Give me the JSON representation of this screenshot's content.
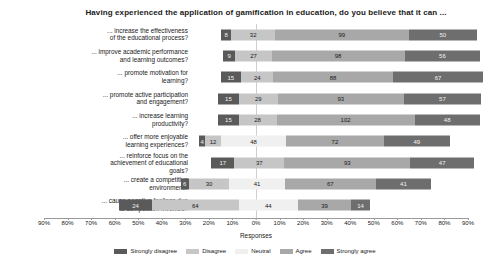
{
  "chart_data": {
    "type": "bar",
    "subtype": "diverging-stacked-likert",
    "title": "Having experienced the application of gamification in education, do you believe that it can ...",
    "xlabel": "Responses",
    "ylabel": "",
    "grid": false,
    "legend_position": "bottom",
    "axis_unit": "percent",
    "xlim": [
      -90,
      90
    ],
    "xticks": [
      "90%",
      "80%",
      "70%",
      "60%",
      "50%",
      "40%",
      "30%",
      "20%",
      "10%",
      "0%",
      "10%",
      "20%",
      "30%",
      "40%",
      "50%",
      "60%",
      "70%",
      "80%",
      "90%"
    ],
    "xtick_values": [
      -90,
      -80,
      -70,
      -60,
      -50,
      -40,
      -30,
      -20,
      -10,
      0,
      10,
      20,
      30,
      40,
      50,
      60,
      70,
      80,
      90
    ],
    "categories": [
      "... increase the effectiveness of the educational process?",
      "... improve academic performance and learning outcomes?",
      "... promote motivation for learning?",
      "... promote active participation and engagement?",
      "... increase learning productivity?",
      "... offer more enjoyable learning experiences?",
      "... reinforce focus on the achievement of educational goals?",
      "... create a competitive environment?",
      "... cause negative feelings due to competition involved?"
    ],
    "categories_lines": [
      [
        "... increase the effectiveness",
        "of the educational process?"
      ],
      [
        "... improve academic performance",
        "and learning outcomes?"
      ],
      [
        "... promote motivation for",
        "learning?"
      ],
      [
        "... promote active participation",
        "and engagement?"
      ],
      [
        "... increase learning",
        "productivity?"
      ],
      [
        "... offer more enjoyable",
        "learning experiences?"
      ],
      [
        "... reinforce focus on the",
        "achievement of educational",
        "goals?"
      ],
      [
        "... create a competitive",
        "environment?"
      ],
      [
        "... cause negative feelings due",
        "to competition involved?"
      ]
    ],
    "series": [
      {
        "name": "Strongly disagree",
        "color": "#5a5a5a",
        "values": [
          8,
          9,
          15,
          15,
          15,
          4,
          17,
          6,
          24
        ]
      },
      {
        "name": "Disagree",
        "color": "#c6c6c6",
        "values": [
          32,
          27,
          24,
          29,
          28,
          12,
          37,
          30,
          64
        ]
      },
      {
        "name": "Neutral",
        "color": "#f0f0f0",
        "values": [
          0,
          0,
          0,
          0,
          0,
          48,
          0,
          41,
          44
        ]
      },
      {
        "name": "Agree",
        "color": "#a8a8a8",
        "values": [
          99,
          98,
          88,
          93,
          102,
          72,
          93,
          67,
          39
        ]
      },
      {
        "name": "Strongly agree",
        "color": "#6e6e6e",
        "values": [
          50,
          56,
          67,
          57,
          48,
          49,
          47,
          41,
          14
        ]
      }
    ],
    "rows": [
      {
        "label_lines": [
          "... increase the effectiveness",
          "of the educational process?"
        ],
        "segments": [
          {
            "series": "Strongly disagree",
            "value": 8
          },
          {
            "series": "Disagree",
            "value": 32
          },
          {
            "series": "Agree",
            "value": 99
          },
          {
            "series": "Strongly agree",
            "value": 50
          }
        ],
        "left_offset_pct": -15.0,
        "total": 189
      },
      {
        "label_lines": [
          "... improve academic performance",
          "and learning outcomes?"
        ],
        "segments": [
          {
            "series": "Strongly disagree",
            "value": 9
          },
          {
            "series": "Disagree",
            "value": 27
          },
          {
            "series": "Agree",
            "value": 98
          },
          {
            "series": "Strongly agree",
            "value": 56
          }
        ],
        "left_offset_pct": -14.0,
        "total": 190
      },
      {
        "label_lines": [
          "... promote motivation for",
          "learning?"
        ],
        "segments": [
          {
            "series": "Strongly disagree",
            "value": 15
          },
          {
            "series": "Disagree",
            "value": 24
          },
          {
            "series": "Agree",
            "value": 88
          },
          {
            "series": "Strongly agree",
            "value": 67
          }
        ],
        "left_offset_pct": -15.0,
        "total": 194
      },
      {
        "label_lines": [
          "... promote active participation",
          "and engagement?"
        ],
        "segments": [
          {
            "series": "Strongly disagree",
            "value": 15
          },
          {
            "series": "Disagree",
            "value": 29
          },
          {
            "series": "Agree",
            "value": 93
          },
          {
            "series": "Strongly agree",
            "value": 57
          }
        ],
        "left_offset_pct": -16.0,
        "total": 194
      },
      {
        "label_lines": [
          "... increase learning",
          "productivity?"
        ],
        "segments": [
          {
            "series": "Strongly disagree",
            "value": 15
          },
          {
            "series": "Disagree",
            "value": 28
          },
          {
            "series": "Agree",
            "value": 102
          },
          {
            "series": "Strongly agree",
            "value": 48
          }
        ],
        "left_offset_pct": -16.0,
        "total": 193
      },
      {
        "label_lines": [
          "... offer more enjoyable",
          "learning experiences?"
        ],
        "segments": [
          {
            "series": "Strongly disagree",
            "value": 4
          },
          {
            "series": "Disagree",
            "value": 12
          },
          {
            "series": "Neutral",
            "value": 48
          },
          {
            "series": "Agree",
            "value": 72
          },
          {
            "series": "Strongly agree",
            "value": 49
          }
        ],
        "left_offset_pct": -24.0,
        "total": 185
      },
      {
        "label_lines": [
          "... reinforce focus on the",
          "achievement of educational",
          "goals?"
        ],
        "segments": [
          {
            "series": "Strongly disagree",
            "value": 17
          },
          {
            "series": "Disagree",
            "value": 37
          },
          {
            "series": "Agree",
            "value": 93
          },
          {
            "series": "Strongly agree",
            "value": 47
          }
        ],
        "left_offset_pct": -19.0,
        "total": 194
      },
      {
        "label_lines": [
          "... create a competitive",
          "environment?"
        ],
        "segments": [
          {
            "series": "Strongly disagree",
            "value": 6
          },
          {
            "series": "Disagree",
            "value": 30
          },
          {
            "series": "Neutral",
            "value": 41
          },
          {
            "series": "Agree",
            "value": 67
          },
          {
            "series": "Strongly agree",
            "value": 41
          }
        ],
        "left_offset_pct": -32.0,
        "total": 185
      },
      {
        "label_lines": [
          "... cause negative feelings due",
          "to competition involved?"
        ],
        "segments": [
          {
            "series": "Strongly disagree",
            "value": 24
          },
          {
            "series": "Disagree",
            "value": 64
          },
          {
            "series": "Neutral",
            "value": 44
          },
          {
            "series": "Agree",
            "value": 39
          },
          {
            "series": "Strongly agree",
            "value": 14
          }
        ],
        "left_offset_pct": -58.0,
        "total": 185
      }
    ],
    "legend": [
      {
        "label": "Strongly disagree",
        "color": "#5a5a5a"
      },
      {
        "label": "Disagree",
        "color": "#c6c6c6"
      },
      {
        "label": "Neutral",
        "color": "#f0f0f0"
      },
      {
        "label": "Agree",
        "color": "#a8a8a8"
      },
      {
        "label": "Strongly agree",
        "color": "#6e6e6e"
      }
    ]
  }
}
